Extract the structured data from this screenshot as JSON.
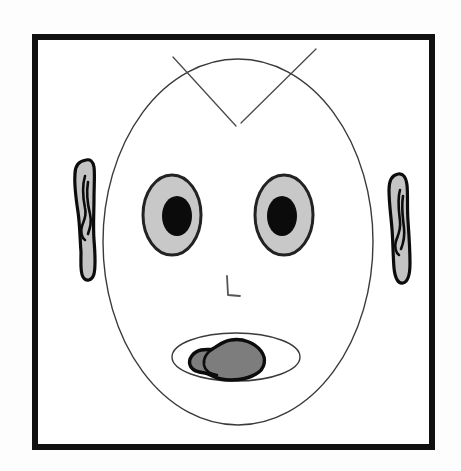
{
  "artwork": {
    "title": "Line drawing of a cartoon face",
    "medium": "black ink line art with gray fills",
    "background_color": "#fdfdfd",
    "canvas": {
      "width": 461,
      "height": 471
    }
  },
  "frame": {
    "name": "picture-frame-border",
    "x": 32,
    "y": 34,
    "width": 403,
    "height": 416,
    "stroke_color": "#111111",
    "stroke_width": 6,
    "fill_color": "#ffffff"
  },
  "figure": {
    "head": {
      "label": "head-outline",
      "shape": "ellipse",
      "cx": 238,
      "cy": 242,
      "rx": 135,
      "ry": 183,
      "stroke_color": "#3a3a3a",
      "stroke_width": 1.4,
      "fill_color": "#ffffff"
    },
    "antennae": {
      "label": "crossing-lines-over-forehead",
      "stroke_color": "#4a4a4a",
      "stroke_width": 1.3,
      "lines": [
        {
          "name": "antenna-left",
          "x1": 173,
          "y1": 57,
          "x2": 236,
          "y2": 126
        },
        {
          "name": "antenna-right",
          "x1": 316,
          "y1": 49,
          "x2": 241,
          "y2": 123
        }
      ]
    },
    "eyes": [
      {
        "name": "eye-left",
        "sclera": {
          "cx": 172,
          "cy": 215,
          "rx": 29,
          "ry": 40,
          "fill_color": "#c8c8c8",
          "stroke_color": "#222222",
          "stroke_width": 3
        },
        "pupil": {
          "cx": 177,
          "cy": 216,
          "rx": 15,
          "ry": 20,
          "fill_color": "#0b0b0b"
        }
      },
      {
        "name": "eye-right",
        "sclera": {
          "cx": 284,
          "cy": 215,
          "rx": 29,
          "ry": 40,
          "fill_color": "#c8c8c8",
          "stroke_color": "#222222",
          "stroke_width": 3
        },
        "pupil": {
          "cx": 282,
          "cy": 216,
          "rx": 15,
          "ry": 20,
          "fill_color": "#0b0b0b"
        }
      }
    ],
    "ears": [
      {
        "name": "ear-left",
        "fill_color": "#c4c4c4",
        "stroke_color": "#0c0c0c",
        "stroke_width": 3.2,
        "outline_path": "M 86 160 C 79 161 75 166 75 174 C 74 186 76 199 78 212 C 80 226 80 240 81 252 C 81 264 80 272 83 277 C 86 282 92 281 94 274 C 96 265 95 252 94 240 C 93 226 94 212 94 199 C 94 186 95 174 94 167 C 93 161 90 159 86 160 Z",
        "inner_path": "M 85 176 C 82 186 83 198 85 208 C 87 216 84 220 82 226 C 80 232 82 238 85 240 M 88 182 C 86 194 88 206 90 214 C 92 222 90 228 88 234"
      },
      {
        "name": "ear-right",
        "fill_color": "#c4c4c4",
        "stroke_color": "#0c0c0c",
        "stroke_width": 3.2,
        "outline_path": "M 398 174 C 392 175 389 181 389 190 C 389 203 391 216 392 229 C 393 242 393 256 394 268 C 395 278 398 284 403 283 C 408 282 410 274 410 263 C 410 249 409 235 408 221 C 407 207 408 194 407 185 C 406 177 403 173 398 174 Z",
        "inner_path": "M 400 190 C 397 200 399 212 400 221 C 401 230 398 235 396 241 C 394 247 396 253 399 255 M 403 196 C 401 208 403 219 404 228 C 405 237 403 244 401 249"
      }
    ],
    "nose": {
      "name": "nose-mark",
      "shape": "L-stroke",
      "path": "M 227 276 L 228 295 L 240 296",
      "stroke_color": "#555555",
      "stroke_width": 1.8
    },
    "mouth": {
      "name": "mouth-opening",
      "shape": "ellipse",
      "cx": 236,
      "cy": 357,
      "rx": 64,
      "ry": 24,
      "stroke_color": "#3a3a3a",
      "stroke_width": 1.4,
      "fill_color": "#ffffff"
    },
    "tongue": {
      "name": "tongue-blob",
      "fill_color": "#7d7d7d",
      "stroke_color": "#0c0c0c",
      "stroke_width": 3.4,
      "path": "M 231 340 C 243 338 255 343 261 351 C 267 359 265 369 256 374 C 246 380 231 381 221 379 C 214 378 210 374 205 373 C 198 372 192 371 190 365 C 188 359 193 352 201 350 C 206 349 209 350 212 349 C 217 347 222 341 231 340 Z",
      "inner_path": "M 213 349 C 207 352 203 358 204 365 C 205 371 211 374 217 375"
    }
  }
}
